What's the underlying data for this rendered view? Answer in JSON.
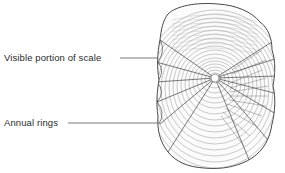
{
  "diagram": {
    "labels": [
      {
        "id": "visible-portion",
        "text": "Visible portion of scale"
      },
      {
        "id": "annual-rings",
        "text": "Annual rings"
      }
    ],
    "colors": {
      "ink": "#2a2a2a",
      "leader_line": "#555555",
      "background": "#ffffff"
    }
  }
}
